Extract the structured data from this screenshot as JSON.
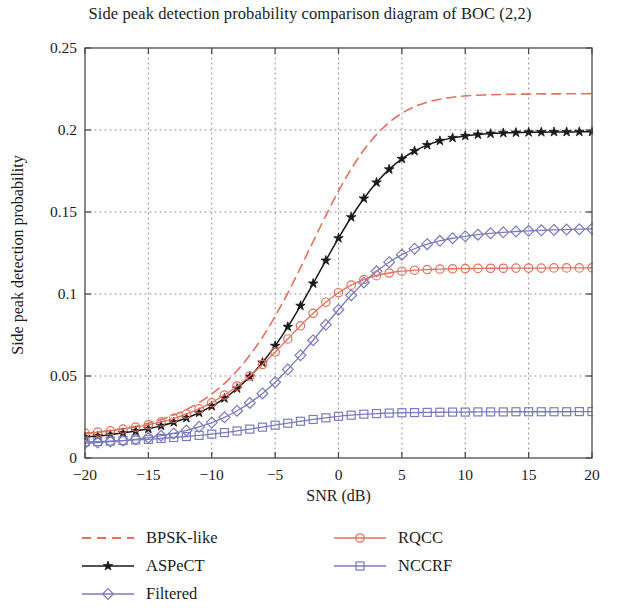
{
  "chart_data": {
    "type": "line",
    "title": "Side peak detection probability comparison diagram of BOC (2,2)",
    "xlabel": "SNR (dB)",
    "ylabel": "Side peak detection probability",
    "xlim": [
      -20,
      20
    ],
    "ylim": [
      0,
      0.25
    ],
    "xticks": [
      -20,
      -15,
      -10,
      -5,
      0,
      5,
      10,
      15,
      20
    ],
    "xtick_labels": [
      "−20",
      "−15",
      "−10",
      "−5",
      "0",
      "5",
      "10",
      "15",
      "20"
    ],
    "yticks": [
      0,
      0.05,
      0.1,
      0.15,
      0.2,
      0.25
    ],
    "ytick_labels": [
      "0",
      "0.05",
      "0.1",
      "0.15",
      "0.2",
      "0.25"
    ],
    "grid": true,
    "grid_style": "dotted",
    "legend_position": "below-plot",
    "x": [
      -20,
      -19,
      -18,
      -17,
      -16,
      -15,
      -14,
      -13,
      -12,
      -11,
      -10,
      -9,
      -8,
      -7,
      -6,
      -5,
      -4,
      -3,
      -2,
      -1,
      0,
      1,
      2,
      3,
      4,
      5,
      6,
      7,
      8,
      9,
      10,
      11,
      12,
      13,
      14,
      15,
      16,
      17,
      18,
      19,
      20
    ],
    "series": [
      {
        "name": "BPSK-like",
        "color": "#E5705C",
        "style": "dashed",
        "marker": "none",
        "values": [
          0.015,
          0.0158,
          0.0168,
          0.018,
          0.0194,
          0.0212,
          0.0234,
          0.0262,
          0.0296,
          0.0338,
          0.039,
          0.0454,
          0.0532,
          0.0626,
          0.0736,
          0.0864,
          0.1006,
          0.116,
          0.132,
          0.1478,
          0.1628,
          0.1762,
          0.1878,
          0.1972,
          0.2046,
          0.2102,
          0.2142,
          0.217,
          0.2188,
          0.22,
          0.2208,
          0.2212,
          0.2215,
          0.2217,
          0.2218,
          0.2219,
          0.222,
          0.222,
          0.2221,
          0.2221,
          0.2222
        ]
      },
      {
        "name": "ASPeCT",
        "color": "#1a1a1a",
        "style": "solid",
        "marker": "star",
        "values": [
          0.0128,
          0.0134,
          0.0142,
          0.0152,
          0.0164,
          0.0178,
          0.0196,
          0.0218,
          0.0244,
          0.0276,
          0.0316,
          0.0364,
          0.0424,
          0.0496,
          0.0582,
          0.0684,
          0.08,
          0.0928,
          0.1064,
          0.1204,
          0.134,
          0.1468,
          0.1582,
          0.168,
          0.176,
          0.1824,
          0.1872,
          0.1908,
          0.1934,
          0.1952,
          0.1964,
          0.1972,
          0.1978,
          0.1982,
          0.1984,
          0.1986,
          0.1987,
          0.1988,
          0.1988,
          0.1989,
          0.1989
        ]
      },
      {
        "name": "Filtered",
        "color": "#7B7BC0",
        "style": "solid",
        "marker": "diamond",
        "values": [
          0.009,
          0.0094,
          0.01,
          0.0106,
          0.0114,
          0.0124,
          0.0136,
          0.015,
          0.0168,
          0.019,
          0.0216,
          0.0248,
          0.0288,
          0.0336,
          0.0394,
          0.0462,
          0.054,
          0.0626,
          0.0718,
          0.0812,
          0.0904,
          0.0992,
          0.107,
          0.1138,
          0.1194,
          0.124,
          0.1276,
          0.1304,
          0.1324,
          0.134,
          0.1352,
          0.1362,
          0.137,
          0.1376,
          0.1381,
          0.1385,
          0.1388,
          0.1391,
          0.1393,
          0.1395,
          0.1398
        ]
      },
      {
        "name": "RQCC",
        "color": "#E5705C",
        "style": "solid",
        "marker": "circle",
        "values": [
          0.0152,
          0.0158,
          0.0166,
          0.0176,
          0.0188,
          0.0202,
          0.022,
          0.0242,
          0.0268,
          0.03,
          0.0338,
          0.0384,
          0.0438,
          0.05,
          0.057,
          0.0646,
          0.0726,
          0.0806,
          0.0882,
          0.095,
          0.1008,
          0.1054,
          0.1088,
          0.1112,
          0.1128,
          0.1139,
          0.1145,
          0.1149,
          0.1152,
          0.1154,
          0.1155,
          0.1156,
          0.1157,
          0.1157,
          0.1158,
          0.1158,
          0.1158,
          0.1159,
          0.1159,
          0.1159,
          0.116
        ]
      },
      {
        "name": "NCCRF",
        "color": "#7B7BC0",
        "style": "solid",
        "marker": "square",
        "values": [
          0.0098,
          0.01,
          0.0103,
          0.0106,
          0.011,
          0.0114,
          0.0119,
          0.0125,
          0.0131,
          0.0138,
          0.0146,
          0.0155,
          0.0165,
          0.0176,
          0.0188,
          0.02,
          0.0212,
          0.0224,
          0.0235,
          0.0245,
          0.0254,
          0.0261,
          0.0267,
          0.0271,
          0.0274,
          0.0276,
          0.0277,
          0.0278,
          0.0279,
          0.028,
          0.028,
          0.0281,
          0.0281,
          0.0281,
          0.0282,
          0.0282,
          0.0282,
          0.0282,
          0.0282,
          0.0283,
          0.0283
        ]
      }
    ]
  },
  "legend": {
    "left_column": [
      {
        "label": "BPSK-like",
        "color": "#E5705C",
        "style": "dashed",
        "marker": "none"
      },
      {
        "label": "ASPeCT",
        "color": "#1a1a1a",
        "style": "solid",
        "marker": "star"
      },
      {
        "label": "Filtered",
        "color": "#7B7BC0",
        "style": "solid",
        "marker": "diamond"
      }
    ],
    "right_column": [
      {
        "label": "RQCC",
        "color": "#E5705C",
        "style": "solid",
        "marker": "circle"
      },
      {
        "label": "NCCRF",
        "color": "#7B7BC0",
        "style": "solid",
        "marker": "square"
      }
    ]
  },
  "colors": {
    "red": "#E5705C",
    "purple": "#7B7BC0",
    "black": "#1a1a1a",
    "axis": "#4d4d4d",
    "grid": "#8a8a8a",
    "background": "#ffffff"
  }
}
